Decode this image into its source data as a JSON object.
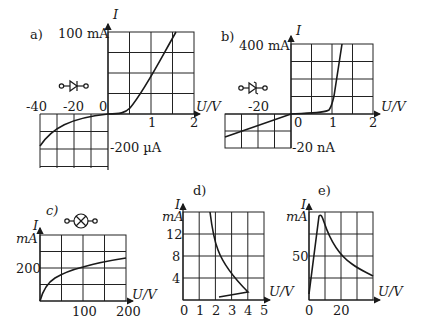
{
  "panels": {
    "a": {
      "label": "a)",
      "ymax_label": "100 mA",
      "ymin_label": "-200 µA",
      "y_axis": "I",
      "x_axis": "U/V",
      "x_ticks_pos": [
        "1",
        "2"
      ],
      "x_ticks_neg": [
        "-40",
        "-20",
        "0"
      ],
      "symbol": "diode-forward"
    },
    "b": {
      "label": "b)",
      "ymax_label": "400 mA",
      "ymin_label": "-20 nA",
      "y_axis": "I",
      "x_axis": "U/V",
      "x_ticks_pos": [
        "0",
        "1",
        "2"
      ],
      "x_ticks_neg": [
        "-20"
      ],
      "symbol": "zener-diode"
    },
    "c": {
      "label": "c)",
      "y_axis": "I",
      "y_unit": "mA",
      "y_tick": "200",
      "x_axis": "U/V",
      "x_ticks": [
        "100",
        "200"
      ],
      "symbol": "lamp"
    },
    "d": {
      "label": "d)",
      "y_axis": "I",
      "y_unit": "mA",
      "y_ticks": [
        "12",
        "8",
        "4"
      ],
      "x_axis": "U/V",
      "x_ticks": [
        "0",
        "1",
        "2",
        "3",
        "4",
        "5"
      ]
    },
    "e": {
      "label": "e)",
      "y_axis": "I",
      "y_unit": "mA",
      "y_tick": "50",
      "x_axis": "U/V",
      "x_ticks": [
        "0",
        "20"
      ]
    }
  },
  "colors": {
    "line": "#1a1a1a",
    "grid": "#222222"
  }
}
